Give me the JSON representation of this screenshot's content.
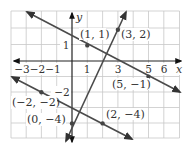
{
  "figure": {
    "axis_labels": {
      "x": "x",
      "y": "y"
    },
    "x_ticks": [
      {
        "value": -3,
        "label": "−3"
      },
      {
        "value": -2,
        "label": "−2"
      },
      {
        "value": -1,
        "label": "−1"
      },
      {
        "value": 1,
        "label": "1"
      },
      {
        "value": 3,
        "label": "3"
      },
      {
        "value": 5,
        "label": "5"
      },
      {
        "value": 6,
        "label": "6"
      }
    ],
    "y_ticks": [
      {
        "value": 1,
        "label": "1"
      },
      {
        "value": -2,
        "label": "−2"
      }
    ],
    "grid": {
      "x_range": [
        -4,
        7
      ],
      "y_range": [
        -5,
        3
      ],
      "step": 1
    },
    "lines": [
      {
        "name": "line-through-1-1-and-5-neg1",
        "points": [
          [
            1,
            1
          ],
          [
            5,
            -1
          ]
        ],
        "slope": -0.5,
        "intercept": 1.5
      },
      {
        "name": "line-through-0-neg4-and-3-2",
        "points": [
          [
            0,
            -4
          ],
          [
            3,
            2
          ]
        ],
        "slope": 2,
        "intercept": -4
      },
      {
        "name": "line-through-neg2-neg2-and-2-neg4",
        "points": [
          [
            -2,
            -2
          ],
          [
            2,
            -4
          ]
        ],
        "slope": -0.5,
        "intercept": -3
      }
    ],
    "point_labels": {
      "p1": "(1, 1)",
      "p2": "(3, 2)",
      "p3": "(5, −1)",
      "p4": "(−2, −2)",
      "p5": "(0, −4)",
      "p6": "(2, −4)"
    },
    "colors": {
      "line": "#4a4a4a",
      "grid": "#c8c8c8",
      "axis": "#222222"
    }
  }
}
